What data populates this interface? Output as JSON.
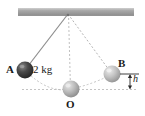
{
  "figure": {
    "labels": {
      "ball_a": "A",
      "mass": "2 kg",
      "ball_b": "B",
      "ball_o": "O",
      "height": "h"
    },
    "colors": {
      "ceiling": "#9a9a9a",
      "ceiling_light": "#d8d8d8",
      "ball_a_dark": "#3a3a3a",
      "ball_a_light": "#6e6e6e",
      "ball_o_dark": "#9d9d9d",
      "ball_o_light": "#d2d2d2",
      "ball_b_dark": "#a5a5a5",
      "ball_b_light": "#d8d8d8",
      "string_solid": "#8a8a8a",
      "string_dashed": "#b8b8b8",
      "arc_dashed": "#bdbdbd",
      "dimension": "#2a2a2a"
    },
    "geometry": {
      "pivot": [
        68,
        14
      ],
      "ball_a_center": [
        25,
        70
      ],
      "ball_o_center": [
        71,
        89
      ],
      "ball_b_center": [
        112,
        74
      ],
      "ball_radius": 8.5,
      "ceiling_x0": 18,
      "ceiling_x1": 134,
      "ceiling_y0": 8,
      "ceiling_y1": 15,
      "baseline_y": 89,
      "h_top_y": 74,
      "h_bottom_y": 89,
      "h_arrow_x": 130
    }
  }
}
